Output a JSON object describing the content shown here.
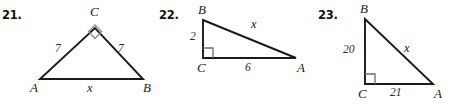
{
  "page": {
    "type": "geometry-worksheet",
    "background_color": "#ffffff",
    "stroke_color": "#1a1a1a",
    "label_color": "#1a1a1a"
  },
  "problems": [
    {
      "number": "21.",
      "name": "problem-21",
      "shape": "isosceles-right-triangle",
      "right_angle_at": "C",
      "vertices": [
        {
          "label": "A",
          "x": 40,
          "y": 79
        },
        {
          "label": "B",
          "x": 143,
          "y": 79
        },
        {
          "label": "C",
          "x": 95,
          "y": 28
        }
      ],
      "vertex_labels": [
        {
          "text": "A",
          "x": 30,
          "y": 82
        },
        {
          "text": "B",
          "x": 144,
          "y": 82
        },
        {
          "text": "C",
          "x": 90,
          "y": 5
        }
      ],
      "side_labels": [
        {
          "text": "7",
          "x": 55,
          "y": 44
        },
        {
          "text": "7",
          "x": 119,
          "y": 44
        },
        {
          "text": "x",
          "x": 88,
          "y": 83
        }
      ],
      "unknown": "x",
      "known_sides": [
        "7",
        "7"
      ]
    },
    {
      "number": "22.",
      "name": "problem-22",
      "shape": "right-triangle",
      "right_angle_at": "C",
      "vertices": [
        {
          "label": "B",
          "x": 203,
          "y": 20
        },
        {
          "label": "C",
          "x": 203,
          "y": 58
        },
        {
          "label": "A",
          "x": 296,
          "y": 58
        }
      ],
      "vertex_labels": [
        {
          "text": "B",
          "x": 198,
          "y": 4
        },
        {
          "text": "C",
          "x": 198,
          "y": 62
        },
        {
          "text": "A",
          "x": 296,
          "y": 62
        }
      ],
      "side_labels": [
        {
          "text": "2",
          "x": 190,
          "y": 31
        },
        {
          "text": "6",
          "x": 245,
          "y": 63
        },
        {
          "text": "x",
          "x": 251,
          "y": 19
        }
      ],
      "unknown": "x",
      "known_sides": [
        "2",
        "6"
      ]
    },
    {
      "number": "23.",
      "name": "problem-23",
      "shape": "right-triangle",
      "right_angle_at": "C",
      "vertices": [
        {
          "label": "B",
          "x": 365,
          "y": 19
        },
        {
          "label": "C",
          "x": 365,
          "y": 84
        },
        {
          "label": "A",
          "x": 433,
          "y": 84
        }
      ],
      "vertex_labels": [
        {
          "text": "B",
          "x": 360,
          "y": 3
        },
        {
          "text": "C",
          "x": 359,
          "y": 87
        },
        {
          "text": "A",
          "x": 433,
          "y": 87
        }
      ],
      "side_labels": [
        {
          "text": "20",
          "x": 345,
          "y": 45
        },
        {
          "text": "21",
          "x": 392,
          "y": 87
        },
        {
          "text": "x",
          "x": 405,
          "y": 43
        }
      ],
      "unknown": "x",
      "known_sides": [
        "20",
        "21"
      ]
    }
  ],
  "problem_numbers": {
    "p21": {
      "text": "21.",
      "x": 2,
      "y": 8
    },
    "p22": {
      "text": "22.",
      "x": 159,
      "y": 8
    },
    "p23": {
      "text": "23.",
      "x": 318,
      "y": 8
    }
  }
}
